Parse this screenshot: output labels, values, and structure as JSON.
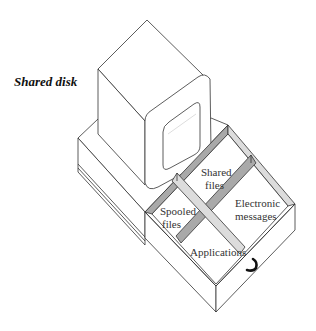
{
  "title": "Shared disk",
  "colors": {
    "line": "#333333",
    "dark_divider": "#a9a9a9",
    "light_divider": "#dcdcdc",
    "background": "#ffffff"
  },
  "drawer": {
    "compartments": [
      {
        "id": "shared-files",
        "lines": [
          "Shared",
          "files"
        ]
      },
      {
        "id": "spooled-files",
        "lines": [
          "Spooled",
          "files"
        ]
      },
      {
        "id": "electronic-messages",
        "lines": [
          "Electronic",
          "messages"
        ]
      },
      {
        "id": "applications",
        "lines": [
          "Applications"
        ]
      }
    ],
    "handle_icon": "drawer-handle-icon"
  },
  "computer": {
    "parts": [
      "monitor",
      "screen",
      "system-unit",
      "open-drawer"
    ]
  }
}
